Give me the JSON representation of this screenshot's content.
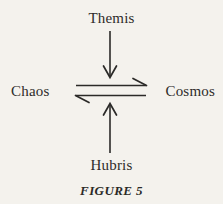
{
  "figure": {
    "caption": "FIGURE 5",
    "background_color": "#f4f2ed",
    "ink_color": "#2b2a28"
  },
  "nodes": {
    "top": "Themis",
    "left": "Chaos",
    "right": "Cosmos",
    "bottom": "Hubris"
  },
  "arrows": [
    {
      "name": "themis-down-arrow",
      "from": "Themis",
      "to": "Chaos-Cosmos equilibrium",
      "direction": "down",
      "head": "full-v"
    },
    {
      "name": "chaos-to-cosmos-arrow",
      "from": "Chaos",
      "to": "Cosmos",
      "direction": "right",
      "head": "half-barb-upper"
    },
    {
      "name": "cosmos-to-chaos-arrow",
      "from": "Cosmos",
      "to": "Chaos",
      "direction": "left",
      "head": "half-barb-lower"
    },
    {
      "name": "hubris-up-arrow",
      "from": "Hubris",
      "to": "Chaos-Cosmos equilibrium",
      "direction": "up",
      "head": "full-v"
    }
  ]
}
